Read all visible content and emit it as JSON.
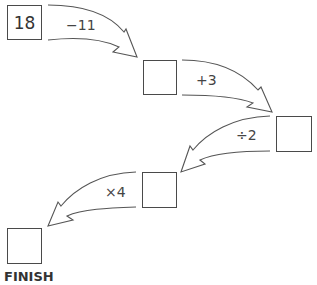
{
  "diagram": {
    "start_value": "18",
    "steps": [
      {
        "operation": "−11",
        "result": ""
      },
      {
        "operation": "+3",
        "result": ""
      },
      {
        "operation": "÷2",
        "result": ""
      },
      {
        "operation": "×4",
        "result": ""
      }
    ],
    "finish_label": "FINISH"
  }
}
